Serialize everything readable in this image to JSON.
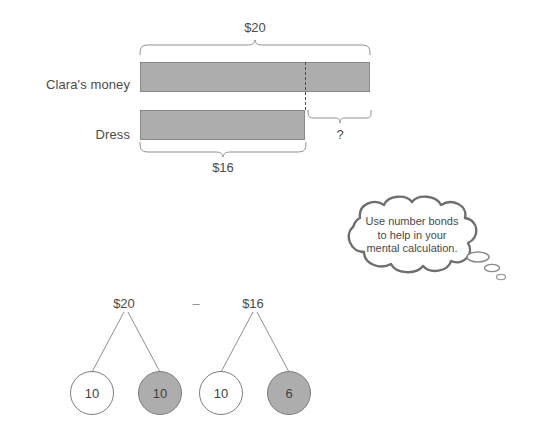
{
  "diagram": {
    "colors": {
      "bar_fill": "#adadad",
      "bar_stroke": "#8a8a8a",
      "line": "#8f8f8f",
      "text": "#4a4a4a",
      "bubble_outline": "#6e6e6e",
      "node_gray": "#adadad",
      "node_white": "#ffffff"
    }
  },
  "bar_model": {
    "rows": [
      {
        "label": "Clara's money",
        "value": "$20"
      },
      {
        "label": "Dress",
        "value": "$16"
      }
    ],
    "top_brace_label": "$20",
    "bottom_brace_label": "$16",
    "unknown_label": "?"
  },
  "thought_bubble": {
    "lines": [
      "Use number bonds",
      "to help in your",
      "mental calculation."
    ]
  },
  "number_bonds": {
    "operator": "–",
    "bonds": [
      {
        "total": "$20",
        "parts": [
          {
            "value": "10",
            "shade": "white"
          },
          {
            "value": "10",
            "shade": "gray"
          }
        ]
      },
      {
        "total": "$16",
        "parts": [
          {
            "value": "10",
            "shade": "white"
          },
          {
            "value": "6",
            "shade": "gray"
          }
        ]
      }
    ]
  }
}
